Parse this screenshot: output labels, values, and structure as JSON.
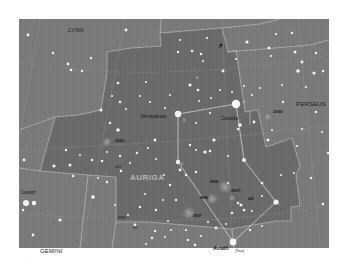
{
  "map": {
    "title": "Auriga star chart",
    "colors": {
      "sky": "#7c7c7c",
      "auriga_region": "#6d6d6d",
      "boundary": "#c8c8c8",
      "figure_line": "#dcdcdc",
      "star": "#f4f4f4",
      "nebula": "#9a9a9a",
      "label": "#1a1a1a",
      "main_label": "#b8b8b8"
    },
    "constellations": [
      {
        "id": "lynx",
        "label": "LYNX"
      },
      {
        "id": "perseus",
        "label": "PERSEUS"
      },
      {
        "id": "auriga",
        "label": "AURIGA"
      },
      {
        "id": "gemini",
        "label": "GEMINI"
      }
    ],
    "named_stars": [
      {
        "id": "capella",
        "label": "Capella"
      },
      {
        "id": "menkalinan",
        "label": "Menkalinan"
      },
      {
        "id": "castor",
        "label": "Castor"
      },
      {
        "id": "alnath",
        "label": "Alnath"
      },
      {
        "id": "alnath-alt",
        "label": "(Tau)"
      }
    ],
    "deep_sky_objects": [
      {
        "id": "m36",
        "label": "M36"
      },
      {
        "id": "m37",
        "label": "M37"
      },
      {
        "id": "m38",
        "label": "M38"
      },
      {
        "id": "ngc1664",
        "label": "1664"
      },
      {
        "id": "ngc2281",
        "label": "2281"
      },
      {
        "id": "ngc1907",
        "label": "1907"
      }
    ],
    "variable_stars": [
      {
        "id": "ae",
        "label": "AE"
      },
      {
        "id": "uu",
        "label": "UU"
      },
      {
        "id": "ww",
        "label": "WW"
      },
      {
        "id": "rt",
        "label": "RT"
      }
    ],
    "greek_letters": [
      {
        "id": "alpha",
        "label": "α"
      },
      {
        "id": "beta",
        "label": "β"
      },
      {
        "id": "theta",
        "label": "θ"
      },
      {
        "id": "iota",
        "label": "ι"
      },
      {
        "id": "kappa",
        "label": "κ"
      },
      {
        "id": "delta",
        "label": "δ"
      }
    ]
  }
}
